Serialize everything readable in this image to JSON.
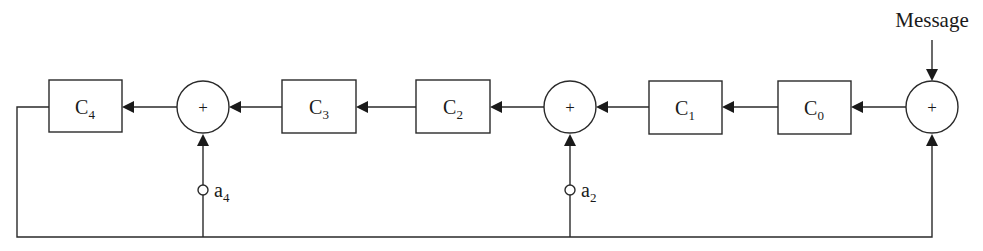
{
  "diagram": {
    "type": "LFSR encoder block diagram",
    "input_label": "Message",
    "registers": [
      {
        "id": "C4",
        "base": "C",
        "sub": "4"
      },
      {
        "id": "C3",
        "base": "C",
        "sub": "3"
      },
      {
        "id": "C2",
        "base": "C",
        "sub": "2"
      },
      {
        "id": "C1",
        "base": "C",
        "sub": "1"
      },
      {
        "id": "C0",
        "base": "C",
        "sub": "0"
      }
    ],
    "adders": [
      {
        "id": "sum-left",
        "symbol": "+"
      },
      {
        "id": "sum-middle",
        "symbol": "+"
      },
      {
        "id": "sum-input",
        "symbol": "+"
      }
    ],
    "taps": [
      {
        "id": "a4",
        "base": "a",
        "sub": "4"
      },
      {
        "id": "a2",
        "base": "a",
        "sub": "2"
      }
    ],
    "colors": {
      "stroke": "#2a2a2a",
      "text": "#1a1a1a",
      "background": "#ffffff"
    }
  }
}
